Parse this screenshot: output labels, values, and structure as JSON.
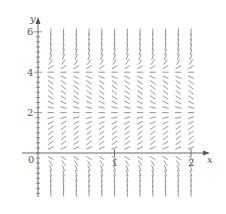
{
  "figure": {
    "type": "slope-field",
    "equation_hint": "dy/dx = y(y-2)(y-4)",
    "x_axis_label": "x",
    "y_axis_label": "y",
    "origin_label": "0",
    "x_ticks": [
      {
        "value": 1,
        "label": "1"
      },
      {
        "value": 2,
        "label": "2"
      }
    ],
    "y_ticks": [
      {
        "value": 2,
        "label": "2"
      },
      {
        "value": 4,
        "label": "4"
      },
      {
        "value": 6,
        "label": "6"
      }
    ],
    "equilibrium_lines": [
      0,
      2,
      4
    ],
    "x_range": [
      0,
      2
    ],
    "y_range": [
      -2,
      6
    ],
    "grid_x_step": 0.1667,
    "grid_y_step": 0.25,
    "colors": {
      "axis": "#666666",
      "segment": "#8a8a8a",
      "text": "#555555",
      "background": "#ffffff"
    }
  },
  "chart_data": {
    "type": "slope-field",
    "title": "",
    "xlabel": "x",
    "ylabel": "y",
    "x_ticks": [
      0,
      1,
      2
    ],
    "y_ticks": [
      0,
      2,
      4,
      6
    ],
    "xlim": [
      0,
      2.1
    ],
    "ylim": [
      -2.2,
      6.5
    ],
    "equilibria": [
      0,
      2,
      4
    ],
    "slope_sign_regions": [
      {
        "y_range": [
          4,
          6.5
        ],
        "sign": "positive, steep"
      },
      {
        "y_range": [
          2,
          4
        ],
        "sign": "negative"
      },
      {
        "y_range": [
          0,
          2
        ],
        "sign": "positive"
      },
      {
        "y_range": [
          -2.2,
          0
        ],
        "sign": "negative, steep"
      }
    ]
  }
}
